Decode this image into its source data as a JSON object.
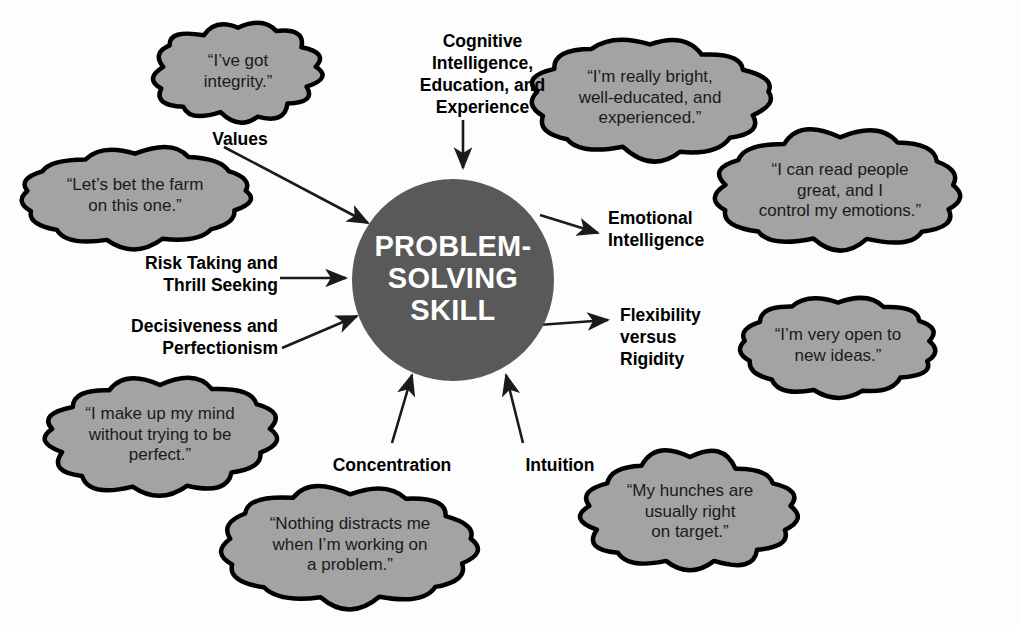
{
  "diagram": {
    "core": {
      "label": "PROBLEM-\nSOLVING\nSKILL",
      "fill": "#595959",
      "text_color": "#ffffff",
      "cx": 453,
      "cy": 280,
      "r": 101
    },
    "colors": {
      "background": "#fdfdfd",
      "cloud_fill": "#a3a3a3",
      "cloud_stroke": "#000000",
      "arrow": "#1a1a1a",
      "label_text": "#000000",
      "cloud_text": "#1a1a1a"
    },
    "factors": [
      {
        "name": "cognitive-intelligence",
        "label": "Cognitive\nIntelligence,\nEducation, and\nExperience",
        "align": "center",
        "label_x": 390,
        "label_y": 31,
        "label_w": 185,
        "quote": "“I’m really bright,\nwell-educated, and\nexperienced.”",
        "cloud_cx": 650,
        "cloud_cy": 98,
        "cloud_rx": 118,
        "cloud_ry": 52,
        "direction": "in"
      },
      {
        "name": "values",
        "label": "Values",
        "align": "center",
        "label_x": 175,
        "label_y": 129,
        "label_w": 130,
        "quote": "“I’ve got\nintegrity.”",
        "cloud_cx": 238,
        "cloud_cy": 72,
        "cloud_rx": 78,
        "cloud_ry": 44,
        "direction": "in"
      },
      {
        "name": "risk-taking",
        "label": "Risk Taking and\nThrill Seeking",
        "align": "right",
        "label_x": 78,
        "label_y": 253,
        "label_w": 200,
        "quote": "“Let’s bet the farm\non this one.”",
        "cloud_cx": 135,
        "cloud_cy": 196,
        "cloud_rx": 112,
        "cloud_ry": 43,
        "direction": "in"
      },
      {
        "name": "decisiveness",
        "label": "Decisiveness and\nPerfectionism",
        "align": "right",
        "label_x": 70,
        "label_y": 316,
        "label_w": 208,
        "quote": "“I make up my mind\nwithout trying to be\nperfect.”",
        "cloud_cx": 160,
        "cloud_cy": 435,
        "cloud_rx": 112,
        "cloud_ry": 52,
        "direction": "in"
      },
      {
        "name": "concentration",
        "label": "Concentration",
        "align": "center",
        "label_x": 312,
        "label_y": 455,
        "label_w": 160,
        "quote": "“Nothing distracts me\nwhen I’m working on\na problem.”",
        "cloud_cx": 350,
        "cloud_cy": 545,
        "cloud_rx": 124,
        "cloud_ry": 54,
        "direction": "in"
      },
      {
        "name": "intuition",
        "label": "Intuition",
        "align": "center",
        "label_x": 500,
        "label_y": 455,
        "label_w": 120,
        "quote": "“My hunches are\nusually right\non target.”",
        "cloud_cx": 690,
        "cloud_cy": 512,
        "cloud_rx": 104,
        "cloud_ry": 52,
        "direction": "in"
      },
      {
        "name": "emotional-intelligence",
        "label": "Emotional\nIntelligence",
        "align": "left",
        "label_x": 608,
        "label_y": 208,
        "label_w": 160,
        "quote": "“I can read people\ngreat, and I\ncontrol my emotions.”",
        "cloud_cx": 840,
        "cloud_cy": 191,
        "cloud_rx": 118,
        "cloud_ry": 52,
        "direction": "out"
      },
      {
        "name": "flexibility",
        "label": "Flexibility\nversus\nRigidity",
        "align": "left",
        "label_x": 620,
        "label_y": 305,
        "label_w": 130,
        "quote": "“I’m very open to\nnew ideas.”",
        "cloud_cx": 838,
        "cloud_cy": 346,
        "cloud_rx": 96,
        "cloud_ry": 43,
        "direction": "out"
      }
    ],
    "arrows": [
      {
        "name": "arrow-cognitive-to-core",
        "x1": 463,
        "y1": 120,
        "x2": 463,
        "y2": 168
      },
      {
        "name": "arrow-values-to-core",
        "x1": 224,
        "y1": 147,
        "x2": 368,
        "y2": 223
      },
      {
        "name": "arrow-risk-to-core",
        "x1": 280,
        "y1": 278,
        "x2": 346,
        "y2": 278
      },
      {
        "name": "arrow-decisiveness-to-core",
        "x1": 282,
        "y1": 348,
        "x2": 357,
        "y2": 316
      },
      {
        "name": "arrow-concentration-to-core",
        "x1": 392,
        "y1": 443,
        "x2": 412,
        "y2": 375
      },
      {
        "name": "arrow-intuition-to-core",
        "x1": 523,
        "y1": 443,
        "x2": 506,
        "y2": 375
      },
      {
        "name": "arrow-core-to-emotional",
        "x1": 540,
        "y1": 215,
        "x2": 598,
        "y2": 233
      },
      {
        "name": "arrow-core-to-flexibility",
        "x1": 538,
        "y1": 325,
        "x2": 608,
        "y2": 320
      }
    ]
  }
}
